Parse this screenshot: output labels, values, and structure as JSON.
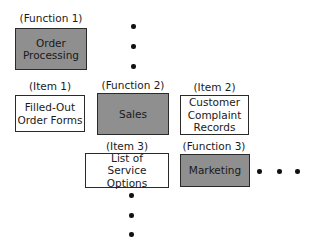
{
  "diagram": {
    "functions": [
      {
        "tag": "(Function 1)",
        "label": "Order\nProcessing"
      },
      {
        "tag": "(Function 2)",
        "label": "Sales"
      },
      {
        "tag": "(Function 3)",
        "label": "Marketing"
      }
    ],
    "items": [
      {
        "tag": "(Item 1)",
        "label": "Filled-Out\nOrder Forms"
      },
      {
        "tag": "(Item 2)",
        "label": "Customer\nComplaint\nRecords"
      },
      {
        "tag": "(Item 3)",
        "label": "List of\nService Options"
      }
    ],
    "colors": {
      "function_fill": "#8f8f8f",
      "item_fill": "#ffffff",
      "border": "#2a2a2a"
    },
    "continuation": {
      "vertical_top": "ellipsis",
      "vertical_bottom": "ellipsis",
      "horizontal_right": "ellipsis"
    }
  }
}
